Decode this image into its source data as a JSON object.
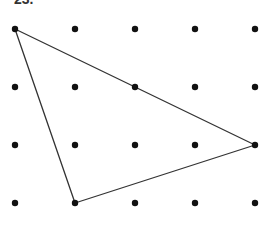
{
  "problem_label": "23.",
  "grid": {
    "columns": 5,
    "rows": 4,
    "x_positions": [
      15,
      75,
      135,
      195,
      255
    ],
    "y_positions": [
      29,
      87,
      145,
      203
    ],
    "dot_radius": 3.2,
    "dot_color": "#111111"
  },
  "triangle": {
    "vertices": [
      {
        "col": 0,
        "row": 0
      },
      {
        "col": 4,
        "row": 2
      },
      {
        "col": 1,
        "row": 3
      }
    ],
    "stroke_color": "#333333",
    "stroke_width": 1.3
  }
}
